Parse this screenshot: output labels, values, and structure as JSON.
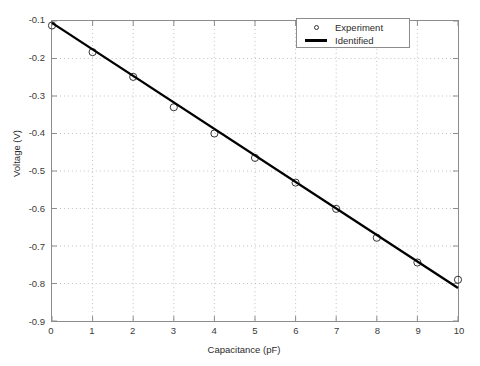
{
  "chart_data": {
    "type": "scatter",
    "title": "",
    "xlabel": "Capacitance (pF)",
    "ylabel": "Voltage (V)",
    "xlim": [
      0,
      10
    ],
    "ylim": [
      -0.9,
      -0.1
    ],
    "xticks": [
      0,
      1,
      2,
      3,
      4,
      5,
      6,
      7,
      8,
      9,
      10
    ],
    "xtick_labels": [
      "0",
      "1",
      "2",
      "3",
      "4",
      "5",
      "6",
      "7",
      "8",
      "9",
      "10"
    ],
    "yticks": [
      -0.9,
      -0.8,
      -0.7,
      -0.6,
      -0.5,
      -0.4,
      -0.3,
      -0.2,
      -0.1
    ],
    "ytick_labels": [
      "-0.9",
      "-0.8",
      "-0.7",
      "-0.6",
      "-0.5",
      "-0.4",
      "-0.3",
      "-0.2",
      "-0.1"
    ],
    "grid": true,
    "grid_style": "dotted",
    "grid_color": "#bfbfbf",
    "legend_position": "top-right",
    "series": [
      {
        "name": "Experiment",
        "type": "scatter",
        "marker": "circle-open",
        "color": "#333333",
        "x": [
          0,
          1,
          2,
          3,
          4,
          5,
          6,
          7,
          8,
          9,
          10
        ],
        "y": [
          -0.112,
          -0.183,
          -0.249,
          -0.33,
          -0.4,
          -0.465,
          -0.531,
          -0.601,
          -0.678,
          -0.744,
          -0.79
        ]
      },
      {
        "name": "Identified",
        "type": "line",
        "color": "#000000",
        "linewidth": 2.4,
        "x": [
          0,
          10
        ],
        "y": [
          -0.105,
          -0.812
        ]
      }
    ]
  },
  "legend": {
    "entries": [
      {
        "label": "Experiment",
        "symbol": "circle-marker"
      },
      {
        "label": "Identified",
        "symbol": "line-marker"
      }
    ]
  },
  "colors": {
    "axis": "#8c8c8c",
    "grid": "#bfbfbf",
    "line": "#000000",
    "marker": "#333333",
    "background": "#ffffff"
  }
}
